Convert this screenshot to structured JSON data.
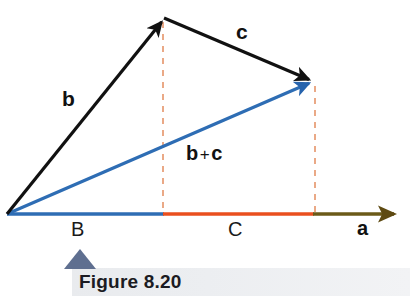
{
  "figure": {
    "caption": "Figure 8.20",
    "caption_marker_icon": "triangle-marker-icon",
    "caption_marker_color": "#5f6f90",
    "background_color": "#ffffff"
  },
  "diagram": {
    "type": "vector-addition-triangle",
    "origin": {
      "x": 7,
      "y": 214
    },
    "vectors": [
      {
        "name": "b",
        "label": "b",
        "color": "#111111",
        "from": {
          "x": 7,
          "y": 214
        },
        "to": {
          "x": 163,
          "y": 18
        },
        "label_position": {
          "x": 62,
          "y": 88
        }
      },
      {
        "name": "c",
        "label": "c",
        "color": "#111111",
        "from": {
          "x": 163,
          "y": 18
        },
        "to": {
          "x": 313,
          "y": 82
        },
        "label_position": {
          "x": 236,
          "y": 21
        }
      },
      {
        "name": "b-plus-c",
        "label_left": "b",
        "label_operator": "+",
        "label_right": "c",
        "color": "#2e6db4",
        "from": {
          "x": 7,
          "y": 214
        },
        "to": {
          "x": 313,
          "y": 82
        },
        "label_position": {
          "x": 186,
          "y": 143
        }
      }
    ],
    "axis": {
      "name": "a",
      "label": "a",
      "label_position": {
        "x": 357,
        "y": 218
      },
      "arrow_color": "#6b5a18",
      "y": 214,
      "start_x": 7,
      "end_x": 400,
      "segments": [
        {
          "name": "B",
          "label": "B",
          "color": "#2e6db4",
          "from_x": 7,
          "to_x": 163,
          "label_position": {
            "x": 71,
            "y": 219
          }
        },
        {
          "name": "C",
          "label": "C",
          "color": "#ea4f1e",
          "from_x": 163,
          "to_x": 313,
          "label_position": {
            "x": 228,
            "y": 219
          }
        },
        {
          "name": "a-tail",
          "label": "",
          "color": "#6b5a18",
          "from_x": 313,
          "to_x": 400,
          "label_position": null
        }
      ]
    },
    "dropline_color": "#e8a07a",
    "droplines": [
      {
        "name": "dropline-b-tip",
        "x": 163,
        "from_y": 20,
        "to_y": 214
      },
      {
        "name": "dropline-c-tip",
        "x": 315,
        "from_y": 85,
        "to_y": 214
      }
    ]
  }
}
